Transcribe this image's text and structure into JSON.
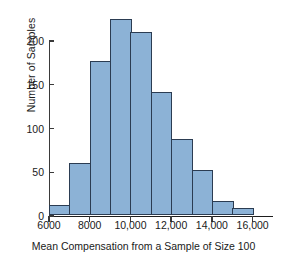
{
  "chart_data": {
    "type": "bar",
    "title": "",
    "subtitle": "",
    "xlabel": "Mean Compensation from a Sample of Size 100",
    "ylabel": "Number of Samples",
    "grid": false,
    "legend": null,
    "legend_position": "none",
    "xlim": [
      6000,
      17000
    ],
    "ylim": [
      0,
      230
    ],
    "bin_width": 1000,
    "bin_edges": [
      6000,
      7000,
      8000,
      9000,
      10000,
      11000,
      12000,
      13000,
      14000,
      15000,
      16000
    ],
    "categories": [
      "6000-7000",
      "7000-8000",
      "8000-9000",
      "9000-10,000",
      "10,000-11,000",
      "11,000-12,000",
      "12,000-13,000",
      "13,000-14,000",
      "14,000-15,000",
      "15,000-16,000"
    ],
    "values": [
      12,
      60,
      176,
      225,
      210,
      141,
      87,
      52,
      16,
      8
    ],
    "xticks": [
      6000,
      8000,
      10000,
      12000,
      14000,
      16000
    ],
    "xtick_labels": [
      "6000",
      "8000",
      "10,000",
      "12,000",
      "14,000",
      "16,000"
    ],
    "yticks": [
      0,
      50,
      100,
      150,
      200
    ],
    "ytick_labels": [
      "0",
      "50",
      "100",
      "150",
      "200"
    ],
    "bar_fill_color": "#8cb2d6",
    "bar_edge_color": "#2b3c52",
    "axis_color": "#3a3a3a",
    "background_color": "#ffffff"
  }
}
